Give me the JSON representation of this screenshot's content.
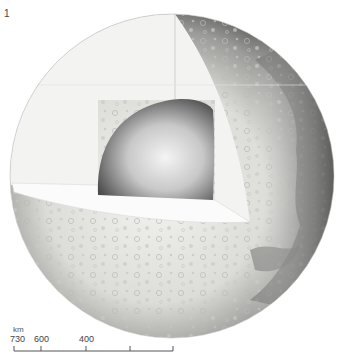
{
  "figure": {
    "number": "1"
  },
  "scale": {
    "unit": "km",
    "labels": [
      {
        "text": "730",
        "x": 10
      },
      {
        "text": "600",
        "x": 34
      },
      {
        "text": "400",
        "x": 79
      }
    ],
    "ticks_x": [
      14,
      41,
      86,
      130,
      173
    ]
  },
  "colors": {
    "background": "#ffffff",
    "mantle": "#f2f2f0",
    "core_light": "#ececec",
    "core_dark": "#555555",
    "surface_light": "#eeeeea",
    "surface_shadow": "#5a5a5a",
    "maria": "#8a8a88"
  }
}
